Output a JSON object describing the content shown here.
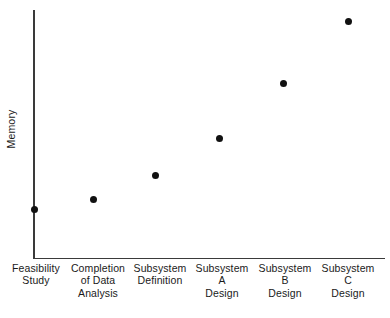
{
  "chart_data": {
    "type": "scatter",
    "title": "",
    "xlabel": "",
    "ylabel": "Memory",
    "grid": false,
    "legend": null,
    "y_tick_labels": [],
    "x_tick_labels": [],
    "axis_style": "L-shaped spine, no tick marks, no numeric scale",
    "ylim": [
      0,
      100
    ],
    "categories": [
      "Feasibility Study",
      "Completion of Data Analysis",
      "Subsystem Definition",
      "Subsystem A Design",
      "Subsystem B Design",
      "Subsystem C Design"
    ],
    "values": [
      20,
      24,
      33,
      48,
      70,
      95
    ],
    "points": [
      {
        "x_px": 34,
        "y_px": 209,
        "value": 20
      },
      {
        "x_px": 93,
        "y_px": 199,
        "value": 24
      },
      {
        "x_px": 155,
        "y_px": 175,
        "value": 33
      },
      {
        "x_px": 219,
        "y_px": 138,
        "value": 48
      },
      {
        "x_px": 283,
        "y_px": 83,
        "value": 70
      },
      {
        "x_px": 348,
        "y_px": 21,
        "value": 95
      }
    ],
    "marker": {
      "shape": "circle",
      "size_px": 7,
      "color": "#111111"
    },
    "colors": {
      "axis": "#3a3a3a",
      "marker": "#111111",
      "text": "#1a1a1a",
      "background": "#ffffff"
    }
  },
  "axis": {
    "y_title": "Memory"
  },
  "category_labels": [
    {
      "lines": [
        "Feasibility",
        "Study"
      ],
      "center_px": 36
    },
    {
      "lines": [
        "Completion",
        "of Data",
        "Analysis"
      ],
      "center_px": 98
    },
    {
      "lines": [
        "Subsystem",
        "Definition"
      ],
      "center_px": 160
    },
    {
      "lines": [
        "Subsystem",
        "A",
        "Design"
      ],
      "center_px": 222
    },
    {
      "lines": [
        "Subsystem",
        "B",
        "Design"
      ],
      "center_px": 285
    },
    {
      "lines": [
        "Subsystem",
        "C",
        "Design"
      ],
      "center_px": 348
    }
  ]
}
